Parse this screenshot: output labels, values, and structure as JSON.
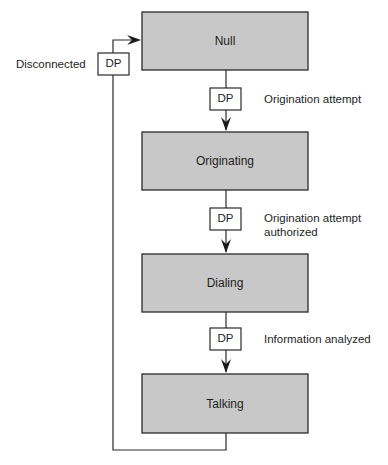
{
  "diagram": {
    "type": "state-flow",
    "colors": {
      "state_fill": "#c8c8c8",
      "stroke": "#2a2a2a",
      "dp_fill": "#ffffff"
    },
    "states": [
      {
        "id": "null",
        "label": "Null"
      },
      {
        "id": "originating",
        "label": "Originating"
      },
      {
        "id": "dialing",
        "label": "Dialing"
      },
      {
        "id": "talking",
        "label": "Talking"
      }
    ],
    "detection_points": [
      {
        "label": "DP",
        "event": "Origination attempt"
      },
      {
        "label": "DP",
        "event": "Origination attempt authorized",
        "event_lines": [
          "Origination attempt",
          "authorized"
        ]
      },
      {
        "label": "DP",
        "event": "Information analyzed"
      },
      {
        "label": "DP",
        "event": "Disconnected"
      }
    ]
  }
}
